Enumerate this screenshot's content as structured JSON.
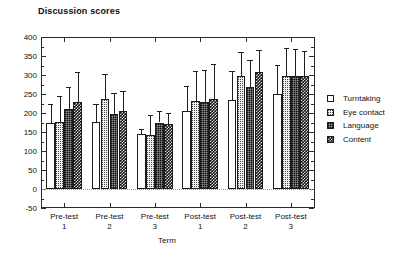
{
  "chart_data": {
    "type": "bar",
    "title": "Discussion scores",
    "xlabel": "Term",
    "ylabel": "",
    "categories": [
      "Pre-test 1",
      "Pre-test 2",
      "Pre-test 3",
      "Post-test 1",
      "Post-test 2",
      "Post-test 3"
    ],
    "category_lines": [
      [
        "Pre-test",
        "1"
      ],
      [
        "Pre-test",
        "2"
      ],
      [
        "Pre-test",
        "3"
      ],
      [
        "Post-test",
        "1"
      ],
      [
        "Post-test",
        "2"
      ],
      [
        "Post-test",
        "3"
      ]
    ],
    "ylim": [
      -50,
      400
    ],
    "ytick_labels": [
      "400",
      "350",
      "300",
      "250",
      "200",
      "150",
      "100",
      "50",
      "0",
      "-50"
    ],
    "ytick_values": [
      400,
      350,
      300,
      250,
      200,
      150,
      100,
      50,
      0,
      -50
    ],
    "ytick_step": 50,
    "minor_ticks": true,
    "grid": false,
    "legend_position": "right",
    "error_bars": "upper only",
    "series": [
      {
        "name": "Turntaking",
        "fill": "white-empty",
        "values": [
          174,
          176,
          146,
          206,
          235,
          250
        ],
        "err_upper": [
          225,
          223,
          159,
          270,
          310,
          327
        ]
      },
      {
        "name": "Eye contact",
        "fill": "light-dotted",
        "values": [
          176,
          236,
          143,
          232,
          298,
          298
        ],
        "err_upper": [
          246,
          303,
          194,
          311,
          360,
          370
        ]
      },
      {
        "name": "Language",
        "fill": "dark-gray-dotted",
        "values": [
          211,
          198,
          175,
          229,
          269,
          298
        ],
        "err_upper": [
          268,
          253,
          205,
          314,
          339,
          369
        ]
      },
      {
        "name": "Content",
        "fill": "dark-checkered",
        "values": [
          229,
          205,
          172,
          237,
          307,
          298
        ],
        "err_upper": [
          307,
          258,
          201,
          330,
          366,
          364
        ]
      }
    ]
  },
  "legend": {
    "items": [
      {
        "label": "Turntaking",
        "swatch": "white-empty"
      },
      {
        "label": "Eye contact",
        "swatch": "light-dotted"
      },
      {
        "label": "Language",
        "swatch": "dark-gray-dotted"
      },
      {
        "label": "Content",
        "swatch": "dark-checkered"
      }
    ]
  }
}
